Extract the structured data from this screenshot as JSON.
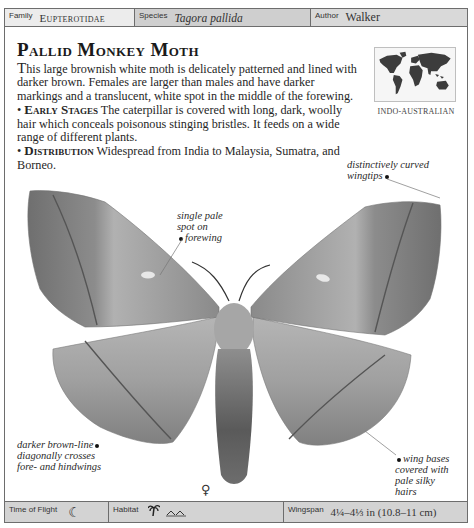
{
  "header": {
    "family_label": "Family",
    "family_value": "Eupterotidae",
    "species_label": "Species",
    "species_value": "Tagora pallida",
    "author_label": "Author",
    "author_value": "Walker"
  },
  "entry": {
    "title": "Pallid Monkey Moth",
    "description_dropcap": "T",
    "description": "his large brownish white moth is delicately patterned and lined with darker brown. Females are larger than males and have darker markings and a translucent, white spot in the middle of the forewing.",
    "sections": [
      {
        "bullet": "•",
        "heading": "Early Stages",
        "text": "The caterpillar is covered with long, dark, woolly hair which conceals poisonous stinging bristles. It feeds on a wide range of different plants."
      },
      {
        "bullet": "•",
        "heading": "Distribution",
        "text": "Widespread from India to Malaysia, Sumatra, and Borneo."
      }
    ]
  },
  "map": {
    "icon": "world-map-icon",
    "region_label": "INDO-AUSTRALIAN"
  },
  "annotations": [
    {
      "id": "wingtips",
      "text_lines": [
        "distinctively curved",
        "wingtips"
      ]
    },
    {
      "id": "spot",
      "text_lines": [
        "single pale",
        "spot on",
        "forewing"
      ]
    },
    {
      "id": "line",
      "text_lines": [
        "darker brown-line",
        "diagonally crosses",
        "fore- and hindwings"
      ]
    },
    {
      "id": "bases",
      "text_lines": [
        "wing bases",
        "covered with",
        "pale silky",
        "hairs"
      ]
    }
  ],
  "specimen": {
    "sex_symbol": "♀",
    "colors": {
      "wing_dark": "#7a7a7a",
      "wing_mid": "#9a9a9a",
      "wing_light": "#b8b8b8",
      "body": "#6e6e6e"
    }
  },
  "footer": {
    "time_label": "Time of Flight",
    "time_icon": "moon-icon",
    "time_glyph": "☾",
    "habitat_label": "Habitat",
    "habitat_icons": [
      "palm-tree-icon",
      "hills-icon"
    ],
    "wingspan_label": "Wingspan",
    "wingspan_value": "4¼–4⅓ in (10.8–11 cm)"
  }
}
